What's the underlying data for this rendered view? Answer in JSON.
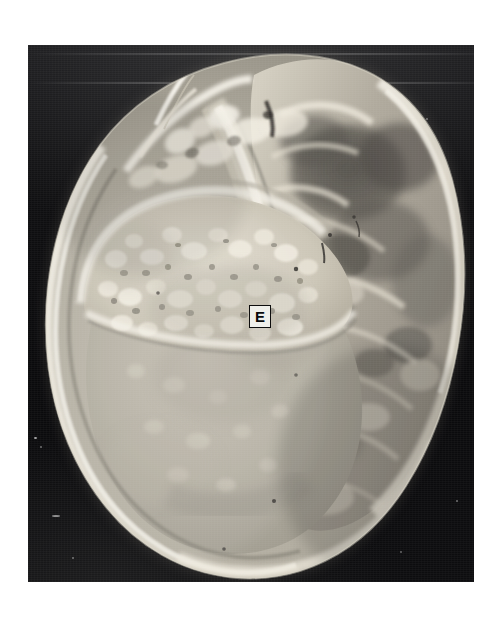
{
  "figure": {
    "domain": "gross-pathology-photograph",
    "kind": "black-and-white photographic plate",
    "orientation": "portrait",
    "plate": {
      "background_color": "#0c0c0e",
      "left": 28,
      "top": 45,
      "width": 446,
      "height": 537
    },
    "page_background_color": "#ffffff"
  },
  "annotations": {
    "callouts": [
      {
        "id": "callout-e",
        "text": "E",
        "shape": "boxed-letter",
        "box_fill": "#efefea",
        "box_border": "#0d0d0d",
        "text_color": "#0a0a0a",
        "x": 221,
        "y": 260,
        "width": 22,
        "height": 23
      }
    ]
  },
  "specimen": {
    "description": "Bisected ovoid mass occupying most of the plate",
    "palette": {
      "background_dark": "#0c0c0e",
      "capsule_highlight": "#f2f0ea",
      "bright_rim": "#ece8de",
      "pale_solid": "#b9b4a8",
      "mid_tissue": "#9d988c",
      "granular_light": "#d8d3c6",
      "cyst_dark": "#4d4a45",
      "shadow_dark": "#2b2a27"
    },
    "regions": [
      {
        "name": "upper-left-granular-nodule",
        "tone": "light granular / nodular",
        "shade": "#d3cdbf"
      },
      {
        "name": "lower-left-smooth-solid",
        "tone": "homogeneous pale grey",
        "shade": "#b5b0a4"
      },
      {
        "name": "central-septum",
        "tone": "bright fibrous band",
        "shade": "#eae5da"
      },
      {
        "name": "right-papillary-mass",
        "tone": "coarse irregular / papillary",
        "shade": "#b2ada1"
      },
      {
        "name": "right-upper-cystic-spaces",
        "tone": "dark cystic loculi",
        "shade": "#4a4742"
      },
      {
        "name": "superior-fimbriated-projections",
        "tone": "bright wispy strands",
        "shade": "#f0ece2"
      },
      {
        "name": "outer-capsule",
        "tone": "thin bright capsule",
        "shade": "#efebe0"
      }
    ]
  }
}
